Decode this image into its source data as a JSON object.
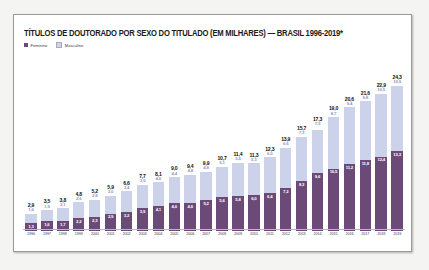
{
  "header": {
    "title": "TÍTULOS DE DOUTORADO POR SEXO DO TITULADO (EM MILHARES) — BRASIL 1996-2019*",
    "legend": [
      {
        "label": "Feminino",
        "color": "#6b4a78",
        "key": "feminino"
      },
      {
        "label": "Masculino",
        "color": "#ccd2ea",
        "key": "masculino"
      }
    ]
  },
  "chart_data": {
    "type": "bar",
    "subtype": "stacked",
    "title": "TÍTULOS DE DOUTORADO POR SEXO DO TITULADO (EM MILHARES) — BRASIL 1996-2019*",
    "xlabel": "",
    "ylabel": "",
    "unit": "milhares",
    "grid": false,
    "legend_position": "top-left",
    "ylim": [
      0,
      25
    ],
    "categories": [
      "1996",
      "1997",
      "1998",
      "1999",
      "2000",
      "2001",
      "2002",
      "2003",
      "2004",
      "2005",
      "2006",
      "2007",
      "2008",
      "2009",
      "2010",
      "2011",
      "2012",
      "2013",
      "2014",
      "2015",
      "2016",
      "2017",
      "2018",
      "2019"
    ],
    "series": [
      {
        "name": "Feminino",
        "color": "#6b4a78",
        "values": [
          1.3,
          1.6,
          1.7,
          2.2,
          2.3,
          2.9,
          3.2,
          3.9,
          4.1,
          4.6,
          4.6,
          5.2,
          5.6,
          5.8,
          6.0,
          6.4,
          7.2,
          8.3,
          9.6,
          10.5,
          11.2,
          11.8,
          12.4,
          13.3
        ]
      },
      {
        "name": "Masculino",
        "color": "#ccd2ea",
        "values": [
          1.6,
          1.9,
          2.1,
          2.6,
          2.8,
          3.0,
          3.4,
          3.9,
          4.0,
          4.4,
          4.8,
          4.8,
          5.1,
          5.6,
          5.3,
          6.0,
          6.6,
          7.3,
          7.3,
          8.7,
          9.4,
          9.8,
          10.5,
          10.9
        ]
      }
    ],
    "totals": [
      2.9,
      3.5,
      3.8,
      4.8,
      5.2,
      5.9,
      6.6,
      7.7,
      8.1,
      9.0,
      9.4,
      9.9,
      10.7,
      11.4,
      11.3,
      12.3,
      13.9,
      15.7,
      17.3,
      19.0,
      20.6,
      21.6,
      22.9,
      24.3
    ],
    "labels": {
      "totals": [
        "2,9",
        "3,5",
        "3,8",
        "4,8",
        "5,2",
        "5,9",
        "6,6",
        "7,7",
        "8,1",
        "9,0",
        "9,4",
        "9,9",
        "10,7",
        "11,4",
        "11,3",
        "12,3",
        "13,9",
        "15,7",
        "17,3",
        "19,0",
        "20,6",
        "21,6",
        "22,9",
        "24,3"
      ],
      "masculino": [
        "1,6",
        "1,9",
        "2,1",
        "2,6",
        "2,8",
        "3,0",
        "3,4",
        "3,9",
        "4,0",
        "4,4",
        "4,8",
        "4,8",
        "5,1",
        "5,6",
        "5,3",
        "6,0",
        "6,6",
        "7,3",
        "7,3",
        "8,7",
        "9,4",
        "9,8",
        "10,5",
        "10,9"
      ],
      "feminino": [
        "1,3",
        "1,6",
        "1,7",
        "2,2",
        "2,3",
        "2,9",
        "3,2",
        "3,9",
        "4,1",
        "4,6",
        "4,6",
        "5,2",
        "5,6",
        "5,8",
        "6,0",
        "6,4",
        "7,2",
        "8,3",
        "9,6",
        "10,5",
        "11,2",
        "11,8",
        "12,4",
        "13,3"
      ]
    }
  }
}
